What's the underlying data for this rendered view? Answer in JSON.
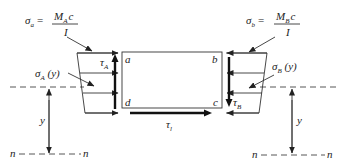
{
  "diagram": {
    "type": "beam-element-stress-diagram",
    "formulas": {
      "left": {
        "lhs": "σ",
        "lhs_sub": "a",
        "eq": "=",
        "num": "M",
        "num_sub": "A",
        "num_tail": "c",
        "den": "I"
      },
      "right": {
        "lhs": "σ",
        "lhs_sub": "b",
        "eq": "=",
        "num": "M",
        "num_sub": "B",
        "num_tail": "c",
        "den": "I"
      }
    },
    "labels": {
      "sigma_A_y": {
        "sym": "σ",
        "sub": "A",
        "tail": " (y)"
      },
      "sigma_B_y": {
        "sym": "σ",
        "sub": "B",
        "tail": " (y)"
      },
      "tau_A": {
        "sym": "τ",
        "sub": "A"
      },
      "tau_B": {
        "sym": "τ",
        "sub": "B"
      },
      "tau_l": {
        "sym": "τ",
        "sub": "l"
      },
      "corner_a": "a",
      "corner_b": "b",
      "corner_c": "c",
      "corner_d": "d",
      "y_left": "y",
      "y_right": "y",
      "n_left_1": "n",
      "n_left_2": "n",
      "n_right_1": "n",
      "n_right_2": "n"
    },
    "colors": {
      "stroke": "#333333",
      "background": "#ffffff"
    }
  }
}
